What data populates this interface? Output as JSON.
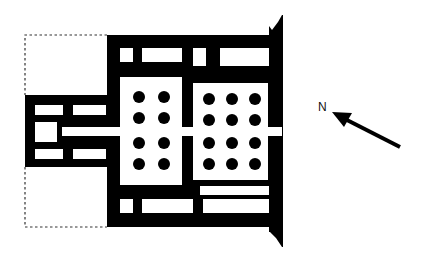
{
  "diagram": {
    "type": "architectural floor plan",
    "colors": {
      "wall": "#000000",
      "background": "#ffffff",
      "outline": "#333333"
    }
  },
  "compass": {
    "label": "N",
    "direction": "north-west arrow"
  },
  "halls": [
    {
      "name": "first columned hall",
      "columns_rows": 4,
      "columns_cols": 2
    },
    {
      "name": "second columned hall",
      "columns_rows": 4,
      "columns_cols": 3
    }
  ],
  "outline": {
    "style": "dashed",
    "meaning": "reconstructed / missing portion"
  }
}
